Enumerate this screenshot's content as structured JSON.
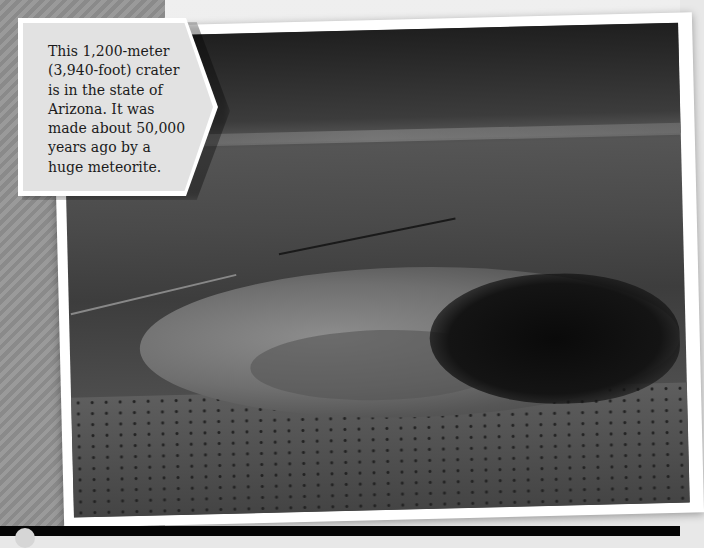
{
  "callout": {
    "text": "This 1,200-meter\n(3,940-foot) crater\nis in the state of\nArizona. It was\nmade about 50,000\nyears ago by a\nhuge meteorite."
  },
  "photo": {
    "subject": "aerial view of meteor crater in Arizona desert",
    "palette": {
      "frame": "#ffffff",
      "stripes_light": "#9a9a9a",
      "stripes_dark": "#8a8a8a",
      "callout_bg": "#e2e2e2",
      "text": "#1b1b1b"
    }
  },
  "icons": {
    "nav_dot": "circle-icon"
  }
}
